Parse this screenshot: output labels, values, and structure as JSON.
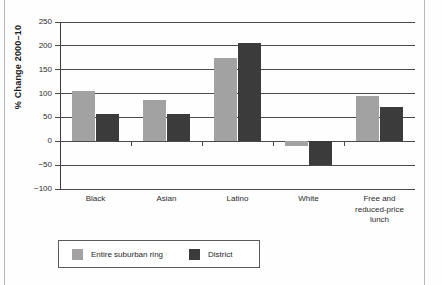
{
  "chart_data": {
    "type": "bar",
    "title": "",
    "xlabel": "",
    "ylabel": "% Change 2000–10",
    "categories": [
      "Black",
      "Asian",
      "Latino",
      "White",
      "Free and\nreduced-price\nlunch"
    ],
    "series": [
      {
        "name": "Entire suburban ring",
        "color": "#a2a2a2",
        "values": [
          105,
          87,
          175,
          -10,
          95
        ]
      },
      {
        "name": "District",
        "color": "#3b3b3b",
        "values": [
          58,
          58,
          205,
          -50,
          72
        ]
      }
    ],
    "ylim": [
      -100,
      250
    ],
    "yticks": [
      250,
      200,
      150,
      100,
      50,
      0,
      -50,
      -100
    ],
    "ytick_labels": [
      "250",
      "200",
      "150",
      "100",
      "50",
      "0",
      "−50",
      "−100"
    ],
    "grid": true,
    "legend_position": "bottom-left"
  },
  "legend": {
    "entries": [
      {
        "label": "Entire suburban ring",
        "color": "#a2a2a2"
      },
      {
        "label": "District",
        "color": "#3b3b3b"
      }
    ]
  },
  "axis": {
    "y_label": "% Change 2000–10"
  },
  "categories": [
    {
      "lines": [
        "Black"
      ]
    },
    {
      "lines": [
        "Asian"
      ]
    },
    {
      "lines": [
        "Latino"
      ]
    },
    {
      "lines": [
        "White"
      ]
    },
    {
      "lines": [
        "Free and",
        "reduced-price",
        "lunch"
      ]
    }
  ]
}
